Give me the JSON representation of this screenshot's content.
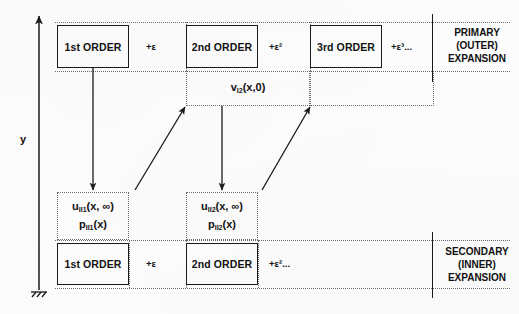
{
  "figure": {
    "title_axis_label": "y",
    "ground_symbol": "fixed-support-hatch"
  },
  "primary": {
    "side_label": "PRIMARY\n(OUTER)\nEXPANSION",
    "terms": [
      {
        "name": "1st ORDER",
        "coefficient": ""
      },
      {
        "name": "2nd ORDER",
        "coefficient": "+ε"
      },
      {
        "name": "3rd ORDER",
        "coefficient": "+ε²"
      }
    ],
    "trailing_coefficient": "+ε³...",
    "coef_1": "+ε",
    "coef_2": "+ε²",
    "coef_3": "+ε³..."
  },
  "secondary": {
    "side_label": "SECONDARY\n(INNER)\nEXPANSION",
    "terms": [
      {
        "name": "1st ORDER"
      },
      {
        "name": "2nd ORDER"
      }
    ],
    "coef_1": "+ε",
    "coef_2": "+ε²..."
  },
  "matching_fields": {
    "outer_second_order": {
      "symbol": "v",
      "subscript": "I2",
      "args": "(x,0)",
      "full": "v_I2(x,0)"
    },
    "inner_first": {
      "u": {
        "symbol": "u",
        "subscript": "II1",
        "args": "(x, ∞)"
      },
      "p": {
        "symbol": "p",
        "subscript": "II1",
        "args": "(x)"
      }
    },
    "inner_second": {
      "u": {
        "symbol": "u",
        "subscript": "II2",
        "args": "(x, ∞)"
      },
      "p": {
        "symbol": "p",
        "subscript": "II2",
        "args": "(x)"
      }
    }
  },
  "colors": {
    "ink": "#111111",
    "dotted": "#6a6a6a",
    "background": "#fdfdfd"
  }
}
